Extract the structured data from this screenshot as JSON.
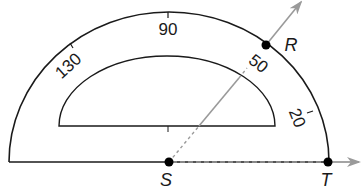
{
  "diagram": {
    "type": "protractor-angle",
    "points": {
      "S": {
        "label": "S",
        "role": "vertex"
      },
      "R": {
        "label": "R"
      },
      "T": {
        "label": "T"
      }
    },
    "rays": [
      {
        "name": "SR",
        "from": "S",
        "through": "R"
      },
      {
        "name": "ST",
        "from": "S",
        "through": "T"
      }
    ],
    "scale_labels": {
      "l130": "130",
      "l90": "90",
      "l50": "50",
      "l20": "20"
    },
    "colors": {
      "outline": "#1a1a1a",
      "ray": "#9a9a9a",
      "point": "#000000"
    }
  }
}
